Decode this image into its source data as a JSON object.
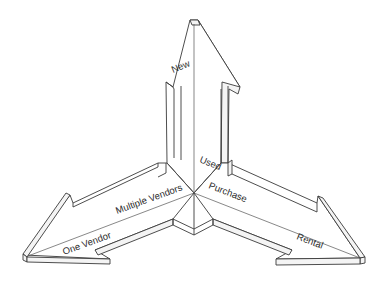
{
  "diagram": {
    "type": "three-way-arrow",
    "arrows": [
      {
        "direction": "up",
        "labels": [
          "New",
          "Used"
        ]
      },
      {
        "direction": "down-left",
        "labels": [
          "Multiple Vendors",
          "One Vendor"
        ]
      },
      {
        "direction": "down-right",
        "labels": [
          "Purchase",
          "Rental"
        ]
      }
    ],
    "labels": {
      "new": "New",
      "used": "Used",
      "multiple_vendors": "Multiple Vendors",
      "one_vendor": "One Vendor",
      "purchase": "Purchase",
      "rental": "Rental"
    },
    "colors": {
      "line": "#3a3a3a",
      "background": "#ffffff",
      "text": "#2a2a2a"
    }
  }
}
